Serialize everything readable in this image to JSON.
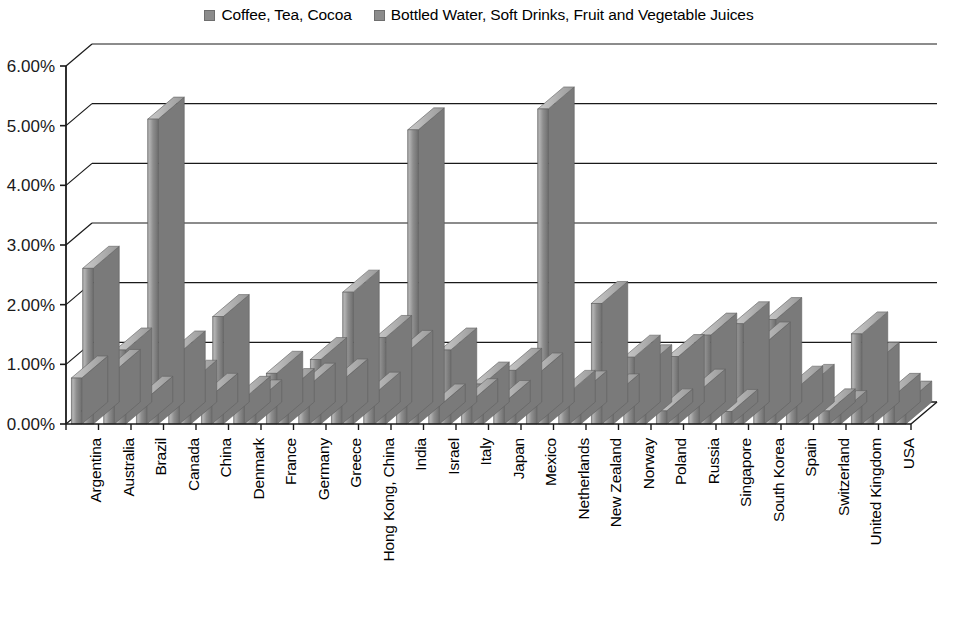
{
  "chart_data": {
    "type": "bar",
    "title": "",
    "subtitle": "",
    "xlabel": "",
    "ylabel": "",
    "ylim": [
      0,
      6
    ],
    "ytick_labels": [
      "0.00%",
      "1.00%",
      "2.00%",
      "3.00%",
      "4.00%",
      "5.00%",
      "6.00%"
    ],
    "ytick_values": [
      0,
      1,
      2,
      3,
      4,
      5,
      6
    ],
    "grid": true,
    "legend_position": "top-center",
    "style": "3d-clustered-column",
    "categories": [
      "Argentina",
      "Australia",
      "Brazil",
      "Canada",
      "China",
      "Denmark",
      "France",
      "Germany",
      "Greece",
      "Hong Kong, China",
      "India",
      "Israel",
      "Italy",
      "Japan",
      "Mexico",
      "Netherlands",
      "New Zealand",
      "Norway",
      "Poland",
      "Russia",
      "Singapore",
      "South Korea",
      "Spain",
      "Switzerland",
      "United Kingdom",
      "USA"
    ],
    "series": [
      {
        "name": "Coffee, Tea, Cocoa",
        "color": "#8f8f8f",
        "values": [
          0.77,
          0.88,
          0.43,
          1.19,
          0.48,
          0.43,
          0.85,
          0.65,
          0.72,
          0.5,
          1.2,
          0.3,
          0.39,
          0.36,
          0.82,
          0.53,
          2.02,
          1.12,
          0.22,
          0.55,
          0.21,
          1.34,
          0.6,
          0.22,
          1.51,
          0.48
        ]
      },
      {
        "name": "Bottled Water, Soft Drinks, Fruit and Vegetable Juices",
        "color": "#8a8a8a",
        "values": [
          2.61,
          1.24,
          5.11,
          0.7,
          1.8,
          0.37,
          0.56,
          1.08,
          2.21,
          1.45,
          4.93,
          1.24,
          0.67,
          0.9,
          5.28,
          0.52,
          0.47,
          0.96,
          1.13,
          1.49,
          1.68,
          1.75,
          0.63,
          0.19,
          1.0,
          0.35
        ]
      }
    ]
  },
  "legend": {
    "entries": [
      {
        "label": "Coffee, Tea, Cocoa"
      },
      {
        "label": "Bottled Water, Soft Drinks, Fruit and Vegetable Juices"
      }
    ]
  },
  "colors": {
    "bar_fill": "#8f8f8f",
    "bar_fill_dark": "#6f6f6f",
    "bar_fill_light": "#b5b5b5",
    "axis": "#1a1a1a",
    "gridline": "#1a1a1a",
    "background": "#ffffff"
  }
}
